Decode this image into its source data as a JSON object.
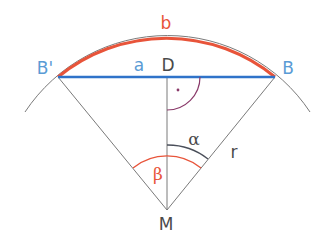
{
  "diagram": {
    "colors": {
      "arc_b": "#e8543a",
      "chord_a": "#2f73c9",
      "point_blue_label": "#5a9bd5",
      "angle_beta": "#e8543a",
      "angle_alpha": "#4a4f5a",
      "right_angle": "#8a3a6a",
      "lines": "#7a7a7a",
      "text_dark": "#4a4a4a"
    },
    "labels": {
      "arc_b": "b",
      "chord_a": "a",
      "point_D": "D",
      "point_B": "B",
      "point_B_prime": "B'",
      "point_M": "M",
      "radius": "r",
      "angle_alpha": "α",
      "angle_beta": "β",
      "right_angle_dot": "·"
    }
  }
}
